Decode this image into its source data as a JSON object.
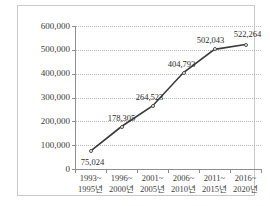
{
  "chart_data": {
    "type": "line",
    "title": "",
    "xlabel": "",
    "ylabel": "",
    "categories": [
      "1993~\n1995년",
      "1996~\n2000년",
      "2001~\n2005년",
      "2006~\n2010년",
      "2011~\n2015년",
      "2016~\n2020년"
    ],
    "category_lines": [
      {
        "top": "1993~",
        "bottom": "1995년"
      },
      {
        "top": "1996~",
        "bottom": "2000년"
      },
      {
        "top": "2001~",
        "bottom": "2005년"
      },
      {
        "top": "2006~",
        "bottom": "2010년"
      },
      {
        "top": "2011~",
        "bottom": "2015년"
      },
      {
        "top": "2016~",
        "bottom": "2020년"
      }
    ],
    "values": [
      75024,
      178305,
      264523,
      404793,
      502043,
      522264
    ],
    "point_labels": [
      "75,024",
      "178,305",
      "264,523",
      "404,793",
      "502,043",
      "522,264"
    ],
    "ylim": [
      0,
      600000
    ],
    "ytick_values": [
      0,
      100000,
      200000,
      300000,
      400000,
      500000,
      600000
    ],
    "ytick_labels": [
      "0",
      "100,000",
      "200,000",
      "300,000",
      "400,000",
      "500,000",
      "600,000"
    ],
    "grid": true,
    "grid_style": "dotted-horizontal",
    "legend": "none",
    "marker": "open-circle",
    "line_color": "#3a3a3a",
    "grid_color": "#b9b9b9",
    "axis_color": "#8e8e8e",
    "text_color": "#3b3b3b"
  }
}
